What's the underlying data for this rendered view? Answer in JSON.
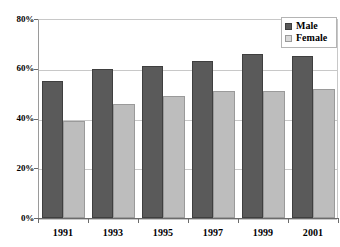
{
  "chart_data": {
    "type": "bar",
    "title": "",
    "subtitle": "",
    "xlabel": "",
    "ylabel": "",
    "categories": [
      "1991",
      "1993",
      "1995",
      "1997",
      "1999",
      "2001"
    ],
    "series": [
      {
        "name": "Male",
        "color": "#5a5a5a",
        "values": [
          55,
          60,
          61,
          63,
          66,
          65
        ]
      },
      {
        "name": "Female",
        "color": "#bdbdbd",
        "values": [
          39,
          46,
          49,
          51,
          51,
          52
        ]
      }
    ],
    "ylim": [
      0,
      80
    ],
    "yticks": [
      0,
      20,
      40,
      60,
      80
    ],
    "ytick_labels": [
      "0%",
      "20%",
      "40%",
      "60%",
      "80%"
    ],
    "grid": true,
    "grid_axis": "y",
    "legend_position": "top-right",
    "value_unit": "%"
  },
  "legend": {
    "entries": [
      {
        "label": "Male"
      },
      {
        "label": "Female"
      }
    ]
  },
  "axes": {
    "y_tick_labels": [
      "80%",
      "60%",
      "40%",
      "20%",
      "0%"
    ],
    "x_tick_labels": [
      "1991",
      "1993",
      "1995",
      "1997",
      "1999",
      "2001"
    ]
  },
  "artifacts": {
    "top_text": "",
    "bottom_text": ""
  }
}
